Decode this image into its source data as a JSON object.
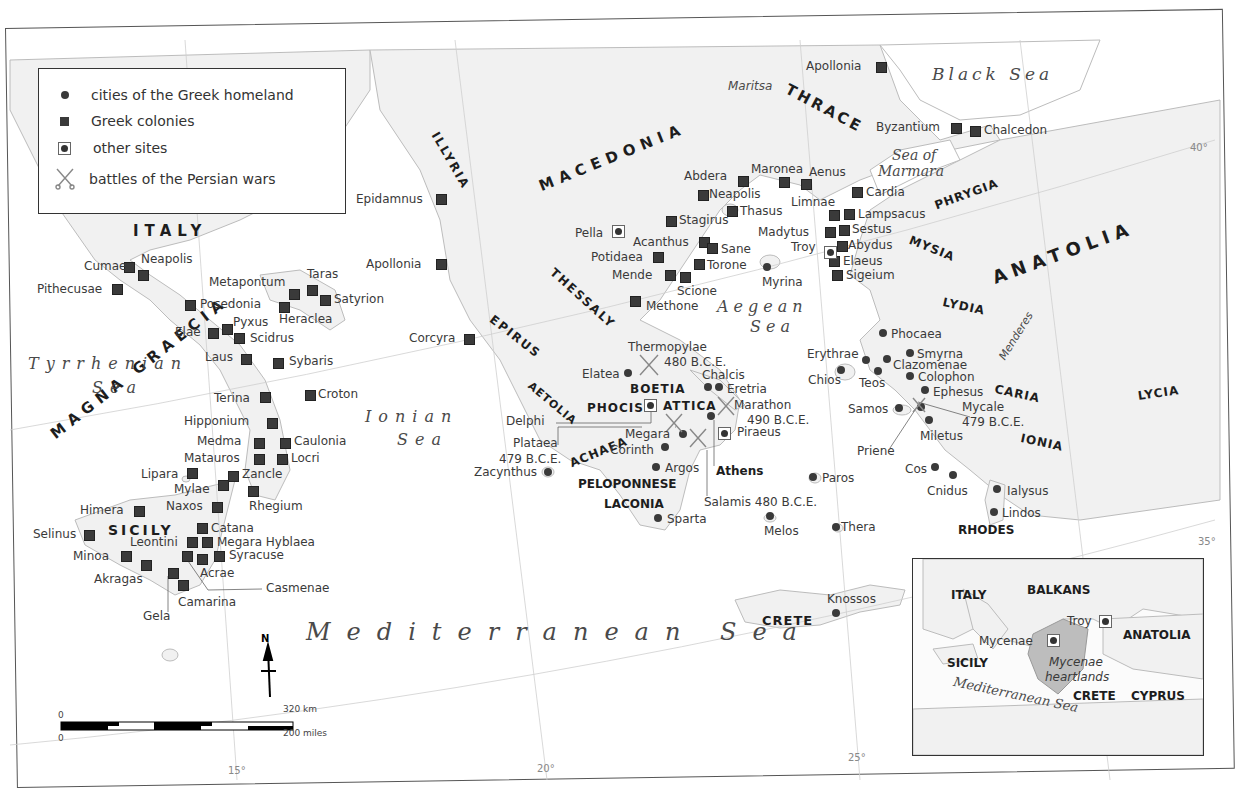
{
  "legend": {
    "items": [
      {
        "symbol": "dot",
        "label": "cities of the Greek homeland"
      },
      {
        "symbol": "square",
        "label": "Greek colonies"
      },
      {
        "symbol": "boxed-dot",
        "label": "other sites"
      },
      {
        "symbol": "crossed-swords",
        "label": "battles of the Persian wars"
      }
    ]
  },
  "regions": {
    "italy": "ITALY",
    "magna_graecia": "MAGNA GRAECIA",
    "sicily": "SICILY",
    "illyria": "ILLYRIA",
    "macedonia": "MACEDONIA",
    "thrace": "THRACE",
    "thessaly": "THESSALY",
    "epirus": "EPIRUS",
    "aetolia": "AETOLIA",
    "phocis": "PHOCIS",
    "boetia": "BOETIA",
    "attica": "ATTICA",
    "achaea": "ACHAEA",
    "peloponnese": "PELOPONNESE",
    "laconia": "LACONIA",
    "phrygia": "PHRYGIA",
    "mysia": "MYSIA",
    "anatolia": "ANATOLIA",
    "lydia": "LYDIA",
    "caria": "CARIA",
    "ionia": "IONIA",
    "lycia": "LYCIA",
    "rhodes": "RHODES",
    "crete": "CRETE"
  },
  "seas": {
    "black_sea": "Black Sea",
    "sea_of_marmara_1": "Sea of",
    "sea_of_marmara_2": "Marmara",
    "aegean_1": "Aegean",
    "aegean_2": "Sea",
    "ionian_1": "Ionian",
    "ionian_2": "Sea",
    "tyrrhenian_1": "Tyrrhenian",
    "tyrrhenian_2": "Sea",
    "mediterranean": "Mediterranean Sea"
  },
  "rivers": {
    "maritsa": "Maritsa",
    "menderes": "Menderes"
  },
  "colonies": [
    {
      "name": "Cumae",
      "x": 128,
      "y": 266
    },
    {
      "name": "Neapolis",
      "x": 142,
      "y": 274
    },
    {
      "name": "Pithecusae",
      "x": 115,
      "y": 288
    },
    {
      "name": "Posedonia",
      "x": 189,
      "y": 304
    },
    {
      "name": "Metapontum",
      "x": 293,
      "y": 294
    },
    {
      "name": "Taras",
      "x": 311,
      "y": 289
    },
    {
      "name": "Satyrion",
      "x": 324,
      "y": 299
    },
    {
      "name": "Heraclea",
      "x": 283,
      "y": 307
    },
    {
      "name": "Elae",
      "x": 212,
      "y": 332
    },
    {
      "name": "Pyxus",
      "x": 226,
      "y": 328
    },
    {
      "name": "Scidrus",
      "x": 238,
      "y": 337
    },
    {
      "name": "Laus",
      "x": 245,
      "y": 358
    },
    {
      "name": "Sybaris",
      "x": 277,
      "y": 362
    },
    {
      "name": "Croton",
      "x": 309,
      "y": 394
    },
    {
      "name": "Terina",
      "x": 264,
      "y": 396
    },
    {
      "name": "Hipponium",
      "x": 271,
      "y": 422
    },
    {
      "name": "Medma",
      "x": 258,
      "y": 442
    },
    {
      "name": "Caulonia",
      "x": 284,
      "y": 442
    },
    {
      "name": "Matauros",
      "x": 258,
      "y": 458
    },
    {
      "name": "Locri",
      "x": 281,
      "y": 458
    },
    {
      "name": "Lipara",
      "x": 191,
      "y": 472
    },
    {
      "name": "Zancle",
      "x": 232,
      "y": 475
    },
    {
      "name": "Mylae",
      "x": 222,
      "y": 484
    },
    {
      "name": "Rhegium",
      "x": 252,
      "y": 490
    },
    {
      "name": "Naxos",
      "x": 216,
      "y": 506
    },
    {
      "name": "Himera",
      "x": 138,
      "y": 510
    },
    {
      "name": "Catana",
      "x": 201,
      "y": 527
    },
    {
      "name": "Selinus",
      "x": 88,
      "y": 533
    },
    {
      "name": "Leontini",
      "x": 191,
      "y": 540
    },
    {
      "name": "Megara Hyblaea",
      "x": 206,
      "y": 540
    },
    {
      "name": "Minoa",
      "x": 125,
      "y": 554
    },
    {
      "name": "Syracuse",
      "x": 218,
      "y": 555
    },
    {
      "name": "Acrae",
      "x": 201,
      "y": 558
    },
    {
      "name": "Casmenae",
      "x": 186,
      "y": 555
    },
    {
      "name": "Akragas",
      "x": 145,
      "y": 564
    },
    {
      "name": "Gela",
      "x": 172,
      "y": 572
    },
    {
      "name": "Camarina",
      "x": 182,
      "y": 584
    },
    {
      "name": "Epidamnus",
      "x": 440,
      "y": 198
    },
    {
      "name": "Apollonia",
      "x": 440,
      "y": 263
    },
    {
      "name": "Corcyra",
      "x": 468,
      "y": 338
    },
    {
      "name": "Abdera",
      "x": 742,
      "y": 180
    },
    {
      "name": "Neapolis",
      "x": 702,
      "y": 194
    },
    {
      "name": "Thasus",
      "x": 731,
      "y": 210
    },
    {
      "name": "Maronea",
      "x": 783,
      "y": 181
    },
    {
      "name": "Aenus",
      "x": 805,
      "y": 183
    },
    {
      "name": "Stagirus",
      "x": 670,
      "y": 220
    },
    {
      "name": "Acanthus",
      "x": 703,
      "y": 241
    },
    {
      "name": "Sane",
      "x": 711,
      "y": 247
    },
    {
      "name": "Potidaea",
      "x": 657,
      "y": 256
    },
    {
      "name": "Torone",
      "x": 698,
      "y": 263
    },
    {
      "name": "Mende",
      "x": 669,
      "y": 274
    },
    {
      "name": "Scione",
      "x": 684,
      "y": 276
    },
    {
      "name": "Methone",
      "x": 634,
      "y": 300
    },
    {
      "name": "Apollonia",
      "x": 880,
      "y": 66
    },
    {
      "name": "Byzantium",
      "x": 955,
      "y": 127
    },
    {
      "name": "Chalcedon",
      "x": 974,
      "y": 130
    },
    {
      "name": "Cardia",
      "x": 856,
      "y": 191
    },
    {
      "name": "Limnae",
      "x": 833,
      "y": 214
    },
    {
      "name": "Lampsacus",
      "x": 848,
      "y": 213
    },
    {
      "name": "Madytus",
      "x": 829,
      "y": 231
    },
    {
      "name": "Sestus",
      "x": 843,
      "y": 229
    },
    {
      "name": "Abydus",
      "x": 841,
      "y": 245
    },
    {
      "name": "Elaeus",
      "x": 833,
      "y": 262
    },
    {
      "name": "Sigeium",
      "x": 836,
      "y": 274
    }
  ],
  "homeland_cities": [
    {
      "name": "Myrina",
      "x": 767,
      "y": 267
    },
    {
      "name": "Elatea",
      "x": 628,
      "y": 373
    },
    {
      "name": "Chalcis",
      "x": 708,
      "y": 387
    },
    {
      "name": "Eretria",
      "x": 719,
      "y": 387
    },
    {
      "name": "Megara",
      "x": 683,
      "y": 434
    },
    {
      "name": "Corinth",
      "x": 665,
      "y": 447
    },
    {
      "name": "Argos",
      "x": 656,
      "y": 467
    },
    {
      "name": "Sparta",
      "x": 658,
      "y": 518
    },
    {
      "name": "Zacynthus",
      "x": 548,
      "y": 472
    },
    {
      "name": "Athens",
      "x": 711,
      "y": 416
    },
    {
      "name": "Paros",
      "x": 813,
      "y": 477
    },
    {
      "name": "Melos",
      "x": 770,
      "y": 516
    },
    {
      "name": "Thera",
      "x": 836,
      "y": 527
    },
    {
      "name": "Knossos",
      "x": 836,
      "y": 613
    },
    {
      "name": "Phocaea",
      "x": 883,
      "y": 333
    },
    {
      "name": "Smyrna",
      "x": 910,
      "y": 353
    },
    {
      "name": "Erythrae",
      "x": 866,
      "y": 360
    },
    {
      "name": "Clazomenae",
      "x": 887,
      "y": 359
    },
    {
      "name": "Chios",
      "x": 841,
      "y": 370
    },
    {
      "name": "Teos",
      "x": 878,
      "y": 371
    },
    {
      "name": "Colophon",
      "x": 910,
      "y": 376
    },
    {
      "name": "Ephesus",
      "x": 925,
      "y": 390
    },
    {
      "name": "Samos",
      "x": 899,
      "y": 408
    },
    {
      "name": "Mycale",
      "x": 921,
      "y": 407
    },
    {
      "name": "Miletus",
      "x": 929,
      "y": 420
    },
    {
      "name": "Cos",
      "x": 935,
      "y": 467
    },
    {
      "name": "Cnidus",
      "x": 953,
      "y": 475
    },
    {
      "name": "Ialysus",
      "x": 997,
      "y": 489
    },
    {
      "name": "Lindos",
      "x": 994,
      "y": 512
    }
  ],
  "other_sites": [
    {
      "name": "Pella",
      "x": 612,
      "y": 228
    },
    {
      "name": "Delphi",
      "x": 646,
      "y": 401
    },
    {
      "name": "Piraeus",
      "x": 718,
      "y": 429
    },
    {
      "name": "Troy",
      "x": 826,
      "y": 250
    }
  ],
  "battles": [
    {
      "name": "Thermopylae",
      "year": "480 B.C.E.",
      "x": 650,
      "y": 362
    },
    {
      "name": "Marathon",
      "year": "490 B.C.E.",
      "x": 722,
      "y": 402
    },
    {
      "name": "Plataea",
      "year": "479 B.C.E.",
      "x": 676,
      "y": 420
    },
    {
      "name": "Salamis",
      "year": "480 B.C.E.",
      "x": 693,
      "y": 432
    },
    {
      "name": "Mycale",
      "year": "479 B.C.E.",
      "x": 918,
      "y": 402
    }
  ],
  "labels": {
    "cumae": "Cumae",
    "neapolis_it": "Neapolis",
    "pithecusae": "Pithecusae",
    "posedonia": "Posedonia",
    "metapontum": "Metapontum",
    "taras": "Taras",
    "satyrion": "Satyrion",
    "heraclea": "Heraclea",
    "elae": "Elae",
    "pyxus": "Pyxus",
    "scidrus": "Scidrus",
    "laus": "Laus",
    "sybaris": "Sybaris",
    "croton": "Croton",
    "terina": "Terina",
    "hipponium": "Hipponium",
    "medma": "Medma",
    "caulonia": "Caulonia",
    "matauros": "Matauros",
    "locri": "Locri",
    "lipara": "Lipara",
    "zancle": "Zancle",
    "mylae": "Mylae",
    "rhegium": "Rhegium",
    "naxos": "Naxos",
    "himera": "Himera",
    "catana": "Catana",
    "selinus": "Selinus",
    "leontini": "Leontini",
    "megara_hyblaea": "Megara Hyblaea",
    "minoa": "Minoa",
    "syracuse": "Syracuse",
    "acrae": "Acrae",
    "casmenae": "Casmenae",
    "akragas": "Akragas",
    "gela": "Gela",
    "camarina": "Camarina",
    "epidamnus": "Epidamnus",
    "apollonia_w": "Apollonia",
    "corcyra": "Corcyra",
    "abdera": "Abdera",
    "neapolis_th": "Neapolis",
    "thasus": "Thasus",
    "maronea": "Maronea",
    "aenus": "Aenus",
    "stagirus": "Stagirus",
    "acanthus": "Acanthus",
    "sane": "Sane",
    "potidaea": "Potidaea",
    "torone": "Torone",
    "mende": "Mende",
    "scione": "Scione",
    "methone": "Methone",
    "pella": "Pella",
    "myrina": "Myrina",
    "apollonia_e": "Apollonia",
    "byzantium": "Byzantium",
    "chalcedon": "Chalcedon",
    "cardia": "Cardia",
    "limnae": "Limnae",
    "lampsacus": "Lampsacus",
    "madytus": "Madytus",
    "sestus": "Sestus",
    "troy": "Troy",
    "abydus": "Abydus",
    "elaeus": "Elaeus",
    "sigeium": "Sigeium",
    "thermopylae": "Thermopylae",
    "thermopylae_year": "480 B.C.E.",
    "elatea": "Elatea",
    "chalcis": "Chalcis",
    "eretria": "Eretria",
    "marathon": "Marathon",
    "marathon_year": "490 B.C.E.",
    "delphi": "Delphi",
    "plataea": "Plataea",
    "plataea_year": "479 B.C.E.",
    "megara": "Megara",
    "piraeus": "Piraeus",
    "corinth": "Corinth",
    "argos": "Argos",
    "athens": "Athens",
    "zacynthus": "Zacynthus",
    "sparta": "Sparta",
    "salamis": "Salamis 480 B.C.E.",
    "paros": "Paros",
    "melos": "Melos",
    "thera": "Thera",
    "knossos": "Knossos",
    "phocaea": "Phocaea",
    "smyrna": "Smyrna",
    "erythrae": "Erythrae",
    "clazomenae": "Clazomenae",
    "chios": "Chios",
    "teos": "Teos",
    "colophon": "Colophon",
    "ephesus": "Ephesus",
    "samos": "Samos",
    "mycale": "Mycale",
    "mycale_year": "479 B.C.E.",
    "miletus": "Miletus",
    "priene": "Priene",
    "cos": "Cos",
    "cnidus": "Cnidus",
    "ialysus": "Ialysus",
    "lindos": "Lindos"
  },
  "graticule": {
    "lon_15": "15°",
    "lon_20": "20°",
    "lon_25": "25°",
    "lat_40": "40°",
    "lat_35": "35°"
  },
  "scale_bar": {
    "zero_km": "0",
    "km": "320 km",
    "zero_mi": "0",
    "miles": "200 miles"
  },
  "north_arrow": {
    "label": "N"
  },
  "inset": {
    "italy": "ITALY",
    "balkans": "BALKANS",
    "troy": "Troy",
    "anatolia": "ANATOLIA",
    "mycenae": "Mycenae",
    "sicily": "SICILY",
    "heartlands_1": "Mycenae",
    "heartlands_2": "heartlands",
    "crete": "CRETE",
    "cyprus": "CYPRUS",
    "med_sea": "Mediterranean Sea"
  },
  "colors": {
    "land": "#f1f1f1",
    "sea": "#ffffff",
    "marker": "#3a3a3a",
    "coast": "#b8b8b8",
    "heartland": "#bdbdbd"
  }
}
